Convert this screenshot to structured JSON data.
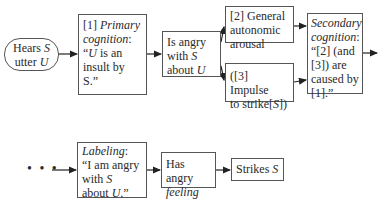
{
  "diagram": {
    "nodes": {
      "hears": {
        "line1_a": "Hears ",
        "line1_b": "S",
        "line2_a": "utter ",
        "line2_b": "U"
      },
      "primary": {
        "tag": "[1] ",
        "label": "Primary",
        "label2": "cognition",
        "colon": ":",
        "q1": "“",
        "u": "U",
        "q2": " is an",
        "l3": "insult by",
        "l4": "S.”"
      },
      "angry": {
        "l1": "Is angry",
        "l2a": "with ",
        "l2b": "S",
        "l3a": "about ",
        "l3b": "U"
      },
      "arousal": {
        "l1": "[2] General",
        "l2": "autonomic",
        "l3": "arousal"
      },
      "impulse": {
        "l1": "([3] Impulse",
        "l2a": "to strike[",
        "l2b": "S",
        "l2c": "])"
      },
      "secondary": {
        "l1": "Secondary",
        "l2": "cognition",
        "colon": ":",
        "l3": "“[2] (and",
        "l4": "[3]) are",
        "l5": "caused by",
        "l6": "[1].”"
      },
      "labeling": {
        "l1": "Labeling",
        "colon": ":",
        "l2": "“I am angry",
        "l3a": "with ",
        "l3b": "S",
        "l4a": "about ",
        "l4b": "U",
        "l4c": ".”"
      },
      "feeling": {
        "l1": "Has angry",
        "l2": "feeling"
      },
      "strikes": {
        "l1a": "Strikes ",
        "l1b": "S"
      }
    },
    "continuation": "• • •",
    "edges": [
      [
        "hears",
        "primary"
      ],
      [
        "primary",
        "angry"
      ],
      [
        "angry",
        "arousal"
      ],
      [
        "angry",
        "impulse"
      ],
      [
        "arousal",
        "secondary"
      ],
      [
        "impulse",
        "secondary"
      ],
      [
        "secondary",
        "continues"
      ],
      [
        "continuation",
        "labeling"
      ],
      [
        "labeling",
        "feeling"
      ],
      [
        "feeling",
        "strikes"
      ]
    ]
  }
}
